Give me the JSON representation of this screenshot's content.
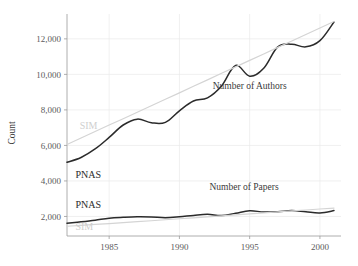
{
  "chart_data": {
    "type": "line",
    "title": "",
    "xlabel": "",
    "ylabel": "Count",
    "xlim": [
      1982,
      2001.5
    ],
    "ylim": [
      900,
      13400
    ],
    "grid": true,
    "legend_position": "inline-annotations",
    "xticks": [
      1985,
      1990,
      1995,
      2000
    ],
    "xtick_labels": [
      "1985",
      "1990",
      "1995",
      "2000"
    ],
    "yticks": [
      2000,
      4000,
      6000,
      8000,
      10000,
      12000
    ],
    "ytick_labels": [
      "2,000",
      "4,000",
      "6,000",
      "8,000",
      "10,000",
      "12,000"
    ],
    "annotations": [
      {
        "text": "Number of Authors",
        "x": 1995.0,
        "y": 9150
      },
      {
        "text": "Number of Papers",
        "x": 1994.6,
        "y": 3500
      },
      {
        "text": "PNAS",
        "x": 1982.6,
        "y": 4150,
        "color": "#2b2b2b",
        "series": "pnas-authors"
      },
      {
        "text": "SIM",
        "x": 1982.9,
        "y": 6950,
        "color": "#cfcfcf",
        "series": "sim-authors"
      },
      {
        "text": "PNAS",
        "x": 1982.6,
        "y": 2480,
        "color": "#2b2b2b",
        "series": "pnas-papers"
      },
      {
        "text": "SIM",
        "x": 1982.6,
        "y": 1230,
        "color": "#cfcfcf",
        "series": "sim-papers"
      }
    ],
    "x": [
      1982,
      1983,
      1984,
      1985,
      1986,
      1987,
      1988,
      1989,
      1990,
      1991,
      1992,
      1993,
      1994,
      1995,
      1996,
      1997,
      1998,
      1999,
      2000,
      2001
    ],
    "series": [
      {
        "name": "PNAS Number of Authors",
        "color": "#2b2b2b",
        "style": "solid-dark",
        "panel": "authors",
        "values": [
          5050,
          5320,
          5800,
          6450,
          7150,
          7480,
          7280,
          7300,
          7950,
          8500,
          8680,
          9350,
          10500,
          9900,
          10350,
          11550,
          11700,
          11550,
          11900,
          12950
        ]
      },
      {
        "name": "SIM Number of Authors",
        "color": "#d4d4d4",
        "style": "solid-light",
        "panel": "authors",
        "values": [
          6050,
          6420,
          6780,
          7150,
          7500,
          7870,
          8230,
          8600,
          8960,
          9330,
          9690,
          10060,
          10420,
          10790,
          11150,
          11520,
          11880,
          12250,
          12610,
          12980
        ]
      },
      {
        "name": "PNAS Number of Papers",
        "color": "#2b2b2b",
        "style": "solid-dark",
        "panel": "papers",
        "values": [
          1620,
          1700,
          1790,
          1900,
          1950,
          1980,
          1970,
          1930,
          1980,
          2060,
          2120,
          2050,
          2180,
          2320,
          2250,
          2270,
          2330,
          2260,
          2200,
          2330
        ]
      },
      {
        "name": "SIM Number of Papers",
        "color": "#d4d4d4",
        "style": "solid-light",
        "panel": "papers",
        "values": [
          1450,
          1500,
          1550,
          1600,
          1650,
          1705,
          1760,
          1815,
          1870,
          1925,
          1980,
          2035,
          2090,
          2145,
          2200,
          2255,
          2310,
          2365,
          2420,
          2475
        ]
      }
    ]
  }
}
